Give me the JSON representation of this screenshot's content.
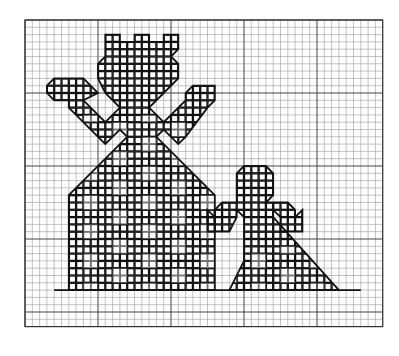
{
  "diagram": {
    "type": "cross-stitch chart on graph paper",
    "grid": {
      "origin_x": 25,
      "origin_y": 20,
      "cell": 7.3,
      "cols": 49,
      "rows": 42,
      "major_every": 10,
      "minor_color": "#9a9a9a",
      "major_color": "#444444"
    },
    "baseline": {
      "row": 37,
      "from_col": 16,
      "to_col": 46
    },
    "figures": [
      {
        "name": "large-figure",
        "outline": [
          [
            11,
            2
          ],
          [
            13,
            2
          ],
          [
            13,
            3
          ],
          [
            15,
            3
          ],
          [
            15,
            2
          ],
          [
            17,
            2
          ],
          [
            17,
            3
          ],
          [
            19,
            3
          ],
          [
            19,
            2
          ],
          [
            21,
            2
          ],
          [
            21,
            4
          ],
          [
            20,
            5
          ],
          [
            21,
            6
          ],
          [
            21,
            8
          ],
          [
            19,
            10
          ],
          [
            17,
            12
          ],
          [
            19,
            14
          ],
          [
            22,
            11
          ],
          [
            22,
            10
          ],
          [
            23,
            9
          ],
          [
            26,
            9
          ],
          [
            26,
            11
          ],
          [
            25,
            12
          ],
          [
            22,
            16
          ],
          [
            21,
            17
          ],
          [
            19,
            15
          ],
          [
            18,
            16
          ],
          [
            26,
            24
          ],
          [
            26,
            37
          ],
          [
            6,
            37
          ],
          [
            6,
            24
          ],
          [
            14,
            16
          ],
          [
            13,
            15
          ],
          [
            11,
            17
          ],
          [
            10,
            16
          ],
          [
            6,
            12
          ],
          [
            6,
            11
          ],
          [
            4,
            11
          ],
          [
            3,
            10
          ],
          [
            3,
            9
          ],
          [
            4,
            8
          ],
          [
            8,
            8
          ],
          [
            10,
            10
          ],
          [
            8,
            11
          ],
          [
            9,
            12
          ],
          [
            11,
            14
          ],
          [
            13,
            12
          ],
          [
            11,
            10
          ],
          [
            10,
            8
          ],
          [
            10,
            6
          ],
          [
            11,
            5
          ],
          [
            11,
            4
          ]
        ],
        "fill_cells_region": {
          "col_from": 3,
          "col_to": 26,
          "row_from": 2,
          "row_to": 37
        }
      },
      {
        "name": "small-figure",
        "outline": [
          [
            29,
            21
          ],
          [
            30,
            20
          ],
          [
            33,
            20
          ],
          [
            34,
            21
          ],
          [
            34,
            24
          ],
          [
            33,
            25
          ],
          [
            36,
            25
          ],
          [
            37,
            26
          ],
          [
            37,
            27
          ],
          [
            38,
            26
          ],
          [
            38,
            29
          ],
          [
            35,
            29
          ],
          [
            35,
            27
          ],
          [
            34,
            26
          ],
          [
            34,
            27
          ],
          [
            43,
            37
          ],
          [
            28,
            37
          ],
          [
            30,
            33
          ],
          [
            30,
            27
          ],
          [
            29,
            26
          ],
          [
            29,
            27
          ],
          [
            28,
            29
          ],
          [
            25,
            29
          ],
          [
            25,
            26
          ],
          [
            26,
            27
          ],
          [
            26,
            26
          ],
          [
            27,
            25
          ],
          [
            29,
            25
          ],
          [
            29,
            24
          ]
        ],
        "fill_cells_region": {
          "col_from": 25,
          "col_to": 43,
          "row_from": 20,
          "row_to": 37
        }
      }
    ]
  }
}
